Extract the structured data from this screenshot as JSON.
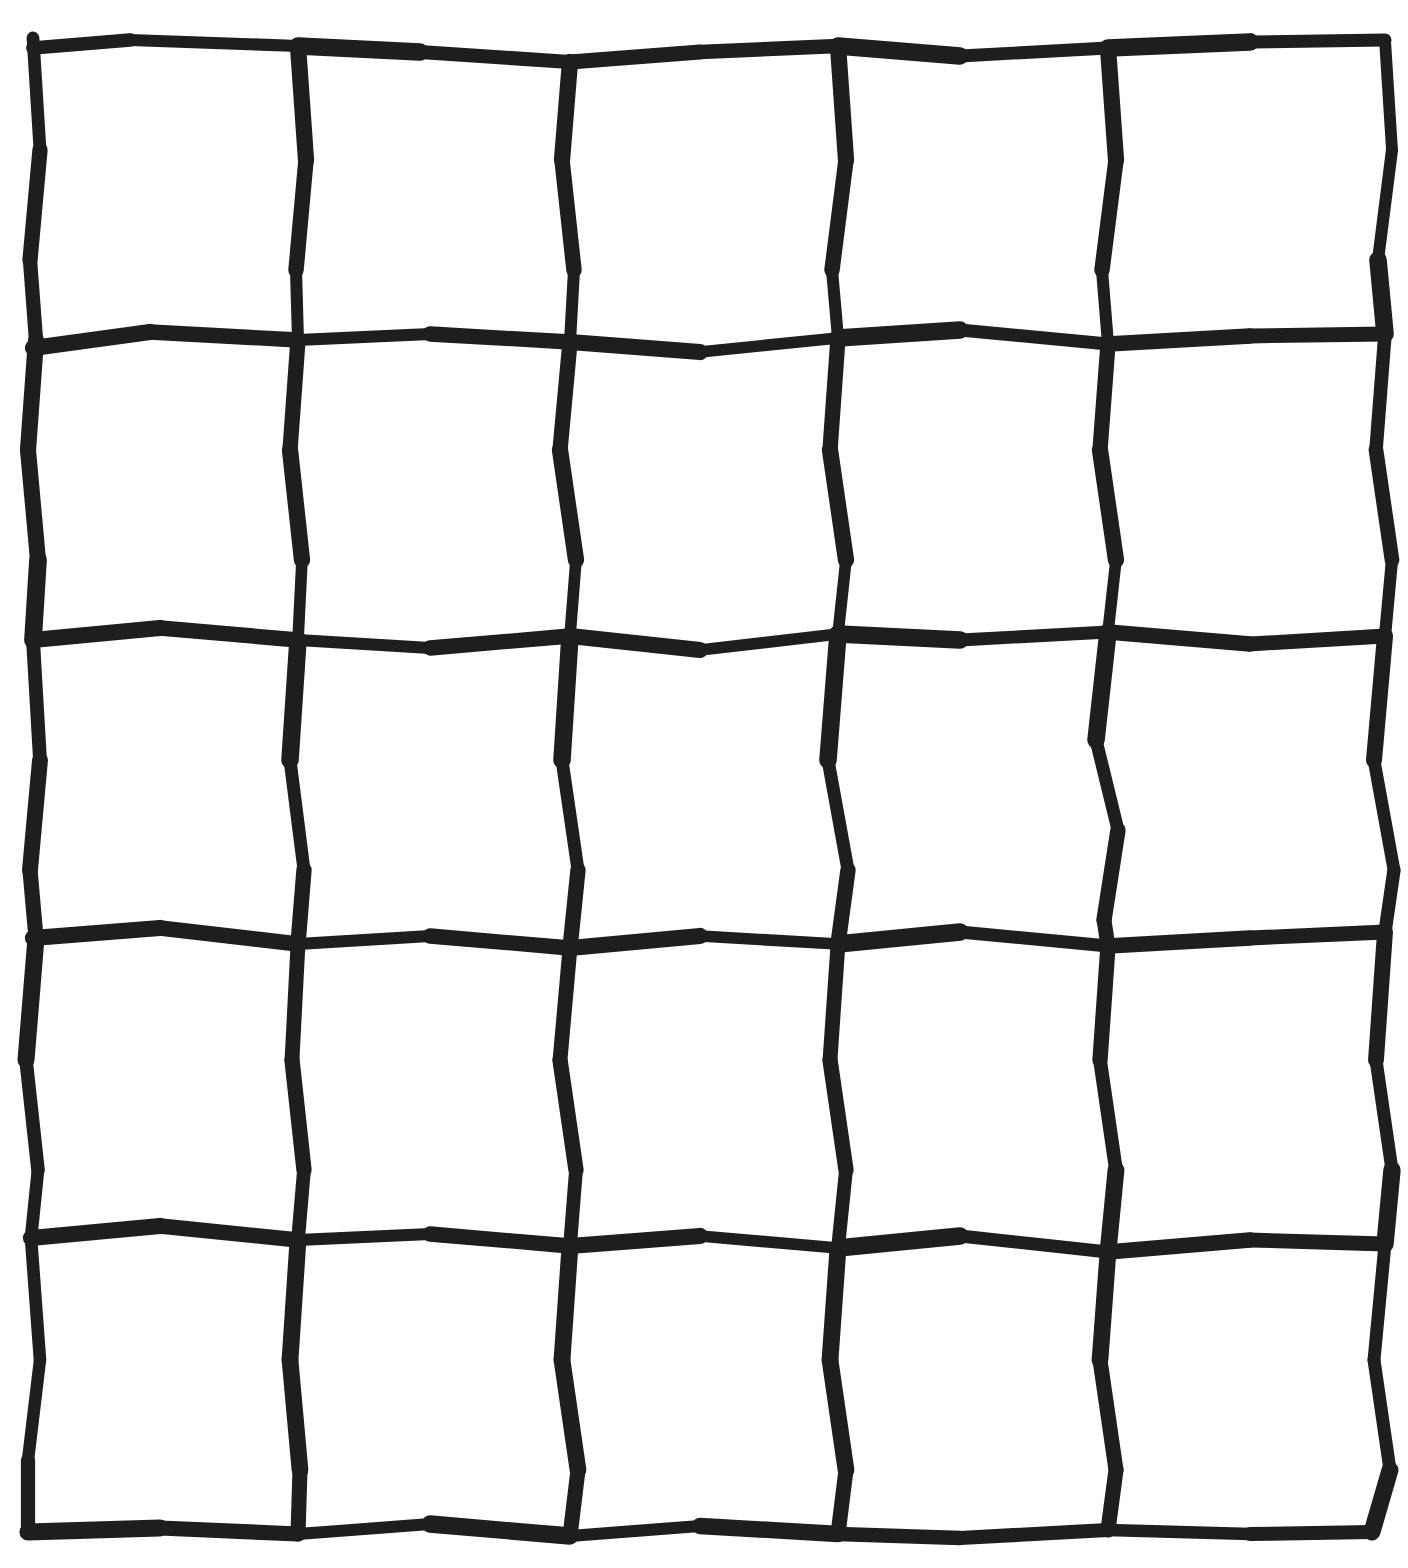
{
  "figure": {
    "type": "line-drawing",
    "style": "hand-drawn",
    "canvas_width": 1408,
    "canvas_height": 1568,
    "background_color": "#ffffff",
    "stroke_color": "#1e1e1e",
    "stroke_width_px": 14,
    "rows": 5,
    "columns": 5,
    "cell_count": 25,
    "line_count_horizontal": 6,
    "line_count_vertical": 6,
    "has_text": false,
    "has_labels": false
  },
  "grid": {
    "bounds": {
      "left": 33,
      "top": 38,
      "right": 1385,
      "bottom": 1532
    },
    "vertical_line_x": [
      33,
      298,
      570,
      838,
      1108,
      1385
    ],
    "horizontal_line_y": [
      38,
      340,
      638,
      930,
      1230,
      1532
    ],
    "horizontal_lines": [
      {
        "name": "h-line-top-border",
        "points": "33,48 130,40 298,46 420,52 570,62 700,52 838,46 960,56 1108,48 1250,42 1385,40"
      },
      {
        "name": "h-line-1",
        "points": "33,348 150,332 298,340 430,334 570,342 700,352 838,338 960,330 1108,344 1250,336 1385,334"
      },
      {
        "name": "h-line-2",
        "points": "33,640 160,628 298,640 430,648 570,636 700,650 838,634 960,640 1108,632 1250,644 1385,636"
      },
      {
        "name": "h-line-3",
        "points": "33,938 160,928 298,944 430,936 570,948 700,936 838,944 960,932 1108,946 1250,938 1385,932"
      },
      {
        "name": "h-line-4",
        "points": "31,1238 160,1226 298,1240 430,1234 570,1246 700,1236 838,1248 960,1236 1108,1252 1250,1240 1385,1244"
      },
      {
        "name": "h-line-bottom-border",
        "points": "28,1532 160,1528 298,1534 430,1524 570,1536 700,1526 838,1534 960,1538 1108,1530 1250,1534 1372,1532"
      }
    ],
    "vertical_lines": [
      {
        "name": "v-line-left-border",
        "points": "33,38 40,150 30,260 36,340 28,450 38,560 33,640 40,760 30,870 36,938 26,1060 38,1170 31,1238 40,1360 28,1460 28,1532"
      },
      {
        "name": "v-line-1",
        "points": "298,46 306,160 296,270 298,340 290,450 302,560 298,640 290,760 304,870 298,944 292,1060 304,1170 298,1240 290,1360 300,1470 298,1534"
      },
      {
        "name": "v-line-2",
        "points": "570,62 562,160 574,270 570,342 560,450 576,560 570,636 562,760 578,870 570,948 560,1060 576,1170 570,1246 562,1360 578,1470 570,1536"
      },
      {
        "name": "v-line-3",
        "points": "838,46 846,160 832,270 838,338 830,450 846,560 838,634 828,760 848,870 838,944 830,1060 846,1170 838,1248 830,1360 846,1470 838,1534"
      },
      {
        "name": "v-line-4",
        "points": "1108,48 1116,160 1102,270 1108,344 1100,450 1116,560 1108,632 1096,740 1118,830 1104,920 1108,946 1100,1060 1116,1170 1108,1252 1100,1360 1116,1470 1108,1530"
      },
      {
        "name": "v-line-right-border",
        "points": "1385,40 1392,150 1378,260 1385,334 1376,450 1392,560 1385,636 1374,760 1394,870 1385,932 1376,1060 1392,1170 1385,1244 1374,1360 1390,1470 1372,1532"
      }
    ],
    "cells": [
      {
        "row": 1,
        "col": 1,
        "name": "cell-r1c1",
        "fill": "#ffffff"
      },
      {
        "row": 1,
        "col": 2,
        "name": "cell-r1c2",
        "fill": "#ffffff"
      },
      {
        "row": 1,
        "col": 3,
        "name": "cell-r1c3",
        "fill": "#ffffff"
      },
      {
        "row": 1,
        "col": 4,
        "name": "cell-r1c4",
        "fill": "#ffffff"
      },
      {
        "row": 1,
        "col": 5,
        "name": "cell-r1c5",
        "fill": "#ffffff"
      },
      {
        "row": 2,
        "col": 1,
        "name": "cell-r2c1",
        "fill": "#ffffff"
      },
      {
        "row": 2,
        "col": 2,
        "name": "cell-r2c2",
        "fill": "#ffffff"
      },
      {
        "row": 2,
        "col": 3,
        "name": "cell-r2c3",
        "fill": "#ffffff"
      },
      {
        "row": 2,
        "col": 4,
        "name": "cell-r2c4",
        "fill": "#ffffff"
      },
      {
        "row": 2,
        "col": 5,
        "name": "cell-r2c5",
        "fill": "#ffffff"
      },
      {
        "row": 3,
        "col": 1,
        "name": "cell-r3c1",
        "fill": "#ffffff"
      },
      {
        "row": 3,
        "col": 2,
        "name": "cell-r3c2",
        "fill": "#ffffff"
      },
      {
        "row": 3,
        "col": 3,
        "name": "cell-r3c3",
        "fill": "#ffffff"
      },
      {
        "row": 3,
        "col": 4,
        "name": "cell-r3c4",
        "fill": "#ffffff"
      },
      {
        "row": 3,
        "col": 5,
        "name": "cell-r3c5",
        "fill": "#ffffff"
      },
      {
        "row": 4,
        "col": 1,
        "name": "cell-r4c1",
        "fill": "#ffffff"
      },
      {
        "row": 4,
        "col": 2,
        "name": "cell-r4c2",
        "fill": "#ffffff"
      },
      {
        "row": 4,
        "col": 3,
        "name": "cell-r4c3",
        "fill": "#ffffff"
      },
      {
        "row": 4,
        "col": 4,
        "name": "cell-r4c4",
        "fill": "#ffffff"
      },
      {
        "row": 4,
        "col": 5,
        "name": "cell-r4c5",
        "fill": "#ffffff"
      },
      {
        "row": 5,
        "col": 1,
        "name": "cell-r5c1",
        "fill": "#ffffff"
      },
      {
        "row": 5,
        "col": 2,
        "name": "cell-r5c2",
        "fill": "#ffffff"
      },
      {
        "row": 5,
        "col": 3,
        "name": "cell-r5c3",
        "fill": "#ffffff"
      },
      {
        "row": 5,
        "col": 4,
        "name": "cell-r5c4",
        "fill": "#ffffff"
      },
      {
        "row": 5,
        "col": 5,
        "name": "cell-r5c5",
        "fill": "#ffffff"
      }
    ]
  }
}
